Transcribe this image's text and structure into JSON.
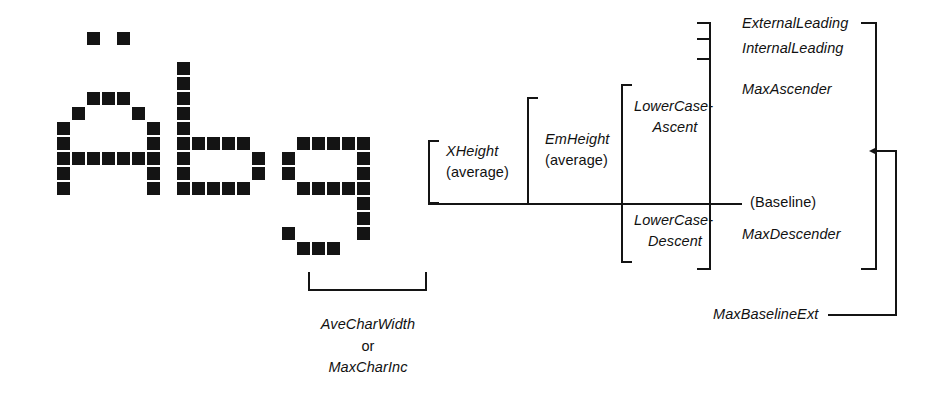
{
  "diagram": {
    "sample_text": "Abg",
    "ink_color": "#141414",
    "background": "#ffffff",
    "glyph_grid": {
      "cell": 13,
      "gap": 2,
      "origin_x": 42,
      "origin_y": 32,
      "note": "bitmap pixel grid for the letters A b g",
      "pixels": [
        [
          3,
          0
        ],
        [
          5,
          0
        ],
        [
          3,
          4
        ],
        [
          4,
          4
        ],
        [
          5,
          4
        ],
        [
          2,
          5
        ],
        [
          6,
          5
        ],
        [
          1,
          6
        ],
        [
          7,
          6
        ],
        [
          1,
          7
        ],
        [
          7,
          7
        ],
        [
          1,
          8
        ],
        [
          2,
          8
        ],
        [
          3,
          8
        ],
        [
          4,
          8
        ],
        [
          5,
          8
        ],
        [
          6,
          8
        ],
        [
          7,
          8
        ],
        [
          1,
          9
        ],
        [
          7,
          9
        ],
        [
          1,
          10
        ],
        [
          7,
          10
        ],
        [
          9,
          2
        ],
        [
          9,
          3
        ],
        [
          9,
          4
        ],
        [
          9,
          5
        ],
        [
          9,
          6
        ],
        [
          9,
          7
        ],
        [
          10,
          7
        ],
        [
          11,
          7
        ],
        [
          12,
          7
        ],
        [
          13,
          7
        ],
        [
          9,
          8
        ],
        [
          14,
          8
        ],
        [
          9,
          9
        ],
        [
          14,
          9
        ],
        [
          9,
          10
        ],
        [
          10,
          10
        ],
        [
          11,
          10
        ],
        [
          12,
          10
        ],
        [
          13,
          10
        ],
        [
          17,
          7
        ],
        [
          18,
          7
        ],
        [
          19,
          7
        ],
        [
          20,
          7
        ],
        [
          21,
          7
        ],
        [
          16,
          8
        ],
        [
          21,
          8
        ],
        [
          16,
          9
        ],
        [
          21,
          9
        ],
        [
          17,
          10
        ],
        [
          18,
          10
        ],
        [
          19,
          10
        ],
        [
          20,
          10
        ],
        [
          21,
          10
        ],
        [
          21,
          11
        ],
        [
          21,
          12
        ],
        [
          16,
          13
        ],
        [
          21,
          13
        ],
        [
          17,
          14
        ],
        [
          18,
          14
        ],
        [
          19,
          14
        ]
      ]
    },
    "brackets": [
      {
        "name": "xheight-bracket",
        "x": 428,
        "top": 140,
        "bottom": 204,
        "arm": 10,
        "side": "left"
      },
      {
        "name": "emheight-bracket",
        "x": 527,
        "top": 97,
        "bottom": 204,
        "arm": 10,
        "side": "left"
      },
      {
        "name": "lowercase-bracket",
        "x": 621,
        "top": 84,
        "bottom": 263,
        "arm": 10,
        "side": "left"
      },
      {
        "name": "maxascender-bracket",
        "x": 709,
        "top": 22,
        "bottom": 270,
        "arm": 10,
        "side": "left"
      },
      {
        "name": "avecharwidth-bracket",
        "x": 308,
        "right": 425,
        "y": 290,
        "arm": 18,
        "side": "bottom"
      },
      {
        "name": "maxbaselineext-bracket",
        "x": 877,
        "top": 22,
        "bottom": 270,
        "arm": 14,
        "side": "right"
      }
    ],
    "labels": {
      "xheight": {
        "line1": "XHeight",
        "line2": "(average)"
      },
      "emheight": {
        "line1": "EmHeight",
        "line2": "(average)"
      },
      "lowercase_ascent": {
        "line1": "LowerCase-",
        "line2": "Ascent"
      },
      "lowercase_descent": {
        "line1": "LowerCase-",
        "line2": "Descent"
      },
      "external_leading": "ExternalLeading",
      "internal_leading": "InternalLeading",
      "max_ascender": "MaxAscender",
      "baseline": "(Baseline)",
      "max_descender": "MaxDescender",
      "max_baseline_ext": "MaxBaselineExt",
      "ave_char_width": {
        "line1": "AveCharWidth",
        "line2": "or",
        "line3": "MaxCharInc"
      }
    },
    "baseline_rule": {
      "name": "baseline-rule",
      "x1": 428,
      "x2": 742,
      "y": 204
    },
    "leading_ticks": [
      {
        "name": "external-leading-tick",
        "y": 22
      },
      {
        "name": "internal-leading-tick",
        "y": 38
      },
      {
        "name": "maxascender-top-tick",
        "y": 58
      }
    ]
  }
}
